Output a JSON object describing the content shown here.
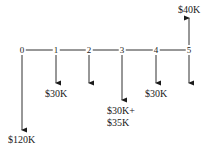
{
  "diagram": {
    "type": "cash-flow-timeline",
    "periods": [
      "0",
      "1",
      "2",
      "3",
      "4",
      "5"
    ],
    "flows": [
      {
        "period": "0",
        "direction": "down",
        "label": "$120K"
      },
      {
        "period": "1",
        "direction": "down",
        "label": "$30K"
      },
      {
        "period": "2",
        "direction": "down",
        "label": ""
      },
      {
        "period": "3",
        "direction": "down",
        "label_line1": "$30K+",
        "label_line2": "$35K"
      },
      {
        "period": "4",
        "direction": "down",
        "label": "$30K"
      },
      {
        "period": "5",
        "direction": "down",
        "label": ""
      },
      {
        "period": "5",
        "direction": "up",
        "label": "$40K"
      }
    ]
  }
}
